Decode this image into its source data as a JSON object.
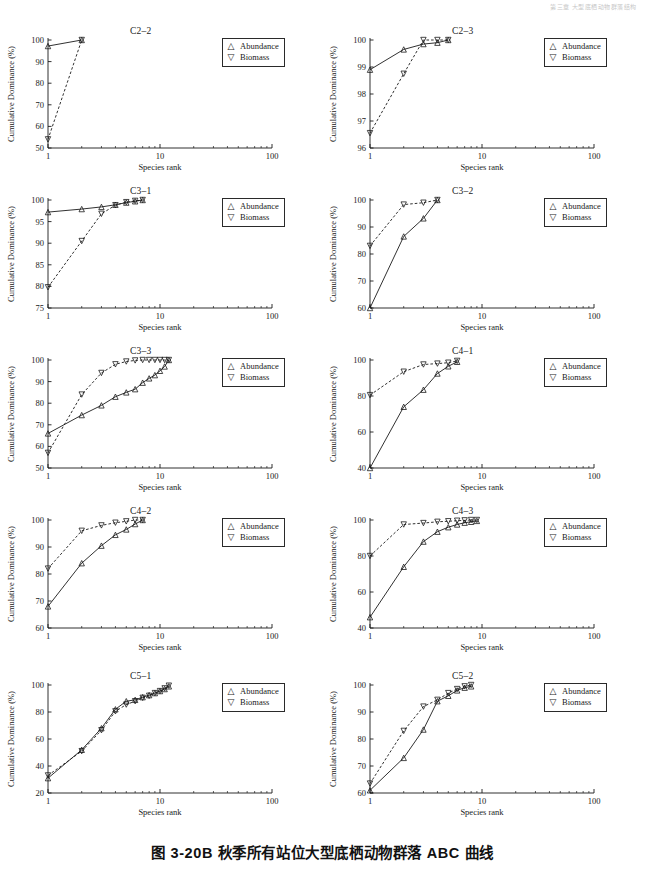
{
  "page": {
    "header_note": "第三章 大型底栖动物群落结构",
    "caption": "图 3-20B  秋季所有站位大型底栖动物群落 ABC 曲线"
  },
  "axes": {
    "xlabel": "Species rank",
    "ylabel": "Cumulative Dominance (%)",
    "xticks": [
      "1",
      "10",
      "100"
    ],
    "xlim": [
      1,
      100
    ],
    "xscale": "log",
    "grid": false
  },
  "legend": {
    "position": "right-of-panel",
    "entries": [
      {
        "glyph": "△",
        "marker": "triangle-up",
        "label": "Abundance"
      },
      {
        "glyph": "▽",
        "marker": "triangle-down",
        "label": "Biomass"
      }
    ]
  },
  "style": {
    "abundance_line": "solid",
    "biomass_line": "dashed",
    "line_color": "#1a1a1a"
  },
  "chart_data": [
    {
      "type": "line",
      "title": "C2–2",
      "xlabel": "Species rank",
      "ylabel": "Cumulative Dominance (%)",
      "xscale": "log",
      "xlim": [
        1,
        100
      ],
      "ylim": [
        50,
        100
      ],
      "yticks": [
        50,
        60,
        70,
        80,
        90,
        100
      ],
      "x": [
        1,
        2
      ],
      "series": [
        {
          "name": "Abundance",
          "values": [
            97.2,
            100.0
          ]
        },
        {
          "name": "Biomass",
          "values": [
            54.0,
            100.0
          ]
        }
      ]
    },
    {
      "type": "line",
      "title": "C2–3",
      "xlabel": "Species rank",
      "ylabel": "Cumulative Dominance (%)",
      "xscale": "log",
      "xlim": [
        1,
        100
      ],
      "ylim": [
        96,
        100
      ],
      "yticks": [
        96,
        97,
        98,
        99,
        100
      ],
      "x": [
        1,
        2,
        3,
        4,
        5
      ],
      "series": [
        {
          "name": "Abundance",
          "values": [
            98.9,
            99.65,
            99.85,
            99.9,
            100.0
          ]
        },
        {
          "name": "Biomass",
          "values": [
            96.55,
            98.75,
            100.0,
            100.0,
            100.0
          ]
        }
      ]
    },
    {
      "type": "line",
      "title": "C3–1",
      "xlabel": "Species rank",
      "ylabel": "Cumulative Dominance (%)",
      "xscale": "log",
      "xlim": [
        1,
        100
      ],
      "ylim": [
        75,
        100
      ],
      "yticks": [
        75,
        80,
        85,
        90,
        95,
        100
      ],
      "x": [
        1,
        2,
        3,
        4,
        5,
        6,
        7
      ],
      "series": [
        {
          "name": "Abundance",
          "values": [
            97.2,
            97.9,
            98.4,
            98.9,
            99.4,
            99.7,
            100.0
          ]
        },
        {
          "name": "Biomass",
          "values": [
            79.8,
            90.5,
            96.8,
            98.8,
            99.5,
            99.8,
            100.0
          ]
        }
      ]
    },
    {
      "type": "line",
      "title": "C3–2",
      "xlabel": "Species rank",
      "ylabel": "Cumulative Dominance (%)",
      "xscale": "log",
      "xlim": [
        1,
        100
      ],
      "ylim": [
        60,
        100
      ],
      "yticks": [
        60,
        70,
        80,
        90,
        100
      ],
      "x": [
        1,
        2,
        3,
        4
      ],
      "series": [
        {
          "name": "Abundance",
          "values": [
            60.0,
            86.5,
            93.2,
            100.0
          ]
        },
        {
          "name": "Biomass",
          "values": [
            83.0,
            98.3,
            99.0,
            100.0
          ]
        }
      ]
    },
    {
      "type": "line",
      "title": "C3–3",
      "xlabel": "Species rank",
      "ylabel": "Cumulative Dominance (%)",
      "xscale": "log",
      "xlim": [
        1,
        100
      ],
      "ylim": [
        50,
        100
      ],
      "yticks": [
        50,
        60,
        70,
        80,
        90,
        100
      ],
      "x": [
        1,
        2,
        3,
        4,
        5,
        6,
        7,
        8,
        9,
        10,
        11,
        12
      ],
      "series": [
        {
          "name": "Abundance",
          "values": [
            66.0,
            74.5,
            79.0,
            83.0,
            85.0,
            86.5,
            89.5,
            91.5,
            93.0,
            95.0,
            97.0,
            100.0
          ]
        },
        {
          "name": "Biomass",
          "values": [
            57.0,
            84.0,
            94.0,
            98.0,
            99.3,
            99.8,
            100.0,
            100.0,
            100.0,
            100.0,
            100.0,
            100.0
          ]
        }
      ]
    },
    {
      "type": "line",
      "title": "C4–1",
      "xlabel": "Species rank",
      "ylabel": "Cumulative Dominance (%)",
      "xscale": "log",
      "xlim": [
        1,
        100
      ],
      "ylim": [
        40,
        100
      ],
      "yticks": [
        40,
        60,
        80,
        100
      ],
      "x": [
        1,
        2,
        3,
        4,
        5,
        6
      ],
      "series": [
        {
          "name": "Abundance",
          "values": [
            40.0,
            74.0,
            83.5,
            92.5,
            96.5,
            99.0
          ]
        },
        {
          "name": "Biomass",
          "values": [
            80.5,
            93.5,
            97.5,
            98.0,
            98.5,
            99.5
          ]
        }
      ]
    },
    {
      "type": "line",
      "title": "C4–2",
      "xlabel": "Species rank",
      "ylabel": "Cumulative Dominance (%)",
      "xscale": "log",
      "xlim": [
        1,
        100
      ],
      "ylim": [
        60,
        100
      ],
      "yticks": [
        60,
        70,
        80,
        90,
        100
      ],
      "x": [
        1,
        2,
        3,
        4,
        5,
        6,
        7
      ],
      "series": [
        {
          "name": "Abundance",
          "values": [
            68.0,
            84.0,
            90.5,
            94.5,
            96.5,
            98.5,
            100.0
          ]
        },
        {
          "name": "Biomass",
          "values": [
            82.0,
            96.0,
            98.0,
            99.0,
            99.5,
            100.0,
            100.0
          ]
        }
      ]
    },
    {
      "type": "line",
      "title": "C4–3",
      "xlabel": "Species rank",
      "ylabel": "Cumulative Dominance (%)",
      "xscale": "log",
      "xlim": [
        1,
        100
      ],
      "ylim": [
        40,
        100
      ],
      "yticks": [
        40,
        60,
        80,
        100
      ],
      "x": [
        1,
        2,
        3,
        4,
        5,
        6,
        7,
        8,
        9
      ],
      "series": [
        {
          "name": "Abundance",
          "values": [
            46.0,
            74.0,
            88.0,
            93.5,
            96.0,
            97.5,
            98.5,
            99.0,
            99.5
          ]
        },
        {
          "name": "Biomass",
          "values": [
            80.0,
            97.5,
            98.3,
            99.0,
            99.3,
            99.6,
            99.8,
            100.0,
            100.0
          ]
        }
      ]
    },
    {
      "type": "line",
      "title": "C5–1",
      "xlabel": "Species rank",
      "ylabel": "Cumulative Dominance (%)",
      "xscale": "log",
      "xlim": [
        1,
        100
      ],
      "ylim": [
        20,
        100
      ],
      "yticks": [
        20,
        40,
        60,
        80,
        100
      ],
      "x": [
        1,
        2,
        3,
        4,
        5,
        6,
        7,
        8,
        9,
        10,
        11,
        12
      ],
      "series": [
        {
          "name": "Abundance",
          "values": [
            31.0,
            52.0,
            68.0,
            82.0,
            88.0,
            89.0,
            91.0,
            92.5,
            94.0,
            95.5,
            97.0,
            99.0
          ]
        },
        {
          "name": "Biomass",
          "values": [
            33.0,
            51.0,
            66.5,
            80.5,
            85.5,
            88.0,
            90.5,
            92.0,
            94.0,
            95.5,
            97.5,
            99.5
          ]
        }
      ]
    },
    {
      "type": "line",
      "title": "C5–2",
      "xlabel": "Species rank",
      "ylabel": "Cumulative Dominance (%)",
      "xscale": "log",
      "xlim": [
        1,
        100
      ],
      "ylim": [
        60,
        100
      ],
      "yticks": [
        60,
        70,
        80,
        90,
        100
      ],
      "x": [
        1,
        2,
        3,
        4,
        5,
        6,
        7,
        8
      ],
      "series": [
        {
          "name": "Abundance",
          "values": [
            61.0,
            73.0,
            83.5,
            94.0,
            96.0,
            98.0,
            99.0,
            99.5
          ]
        },
        {
          "name": "Biomass",
          "values": [
            63.5,
            83.0,
            92.0,
            94.5,
            97.0,
            98.5,
            99.5,
            100.0
          ]
        }
      ]
    }
  ]
}
